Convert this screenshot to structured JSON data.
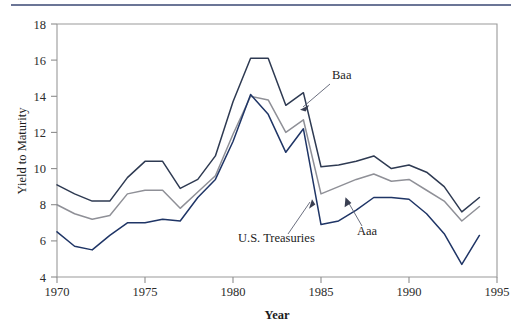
{
  "figure": {
    "top_rule_color": "#6b7596",
    "background": "#ffffff"
  },
  "chart_data": {
    "type": "line",
    "title": "",
    "xlabel": "Year",
    "ylabel": "Yield to Maturity",
    "xlim": [
      1970,
      1995
    ],
    "ylim": [
      4,
      18
    ],
    "xticks": [
      1970,
      1975,
      1980,
      1985,
      1990,
      1995
    ],
    "xtick_labels": [
      "1970",
      "1975",
      "1980",
      "1985",
      "1990",
      "1995"
    ],
    "yticks": [
      4,
      6,
      8,
      10,
      12,
      14,
      16,
      18
    ],
    "ytick_labels": [
      "4",
      "6",
      "8",
      "10",
      "12",
      "14",
      "16",
      "18"
    ],
    "grid": false,
    "legend": "annotations",
    "x": [
      1970,
      1971,
      1972,
      1973,
      1974,
      1975,
      1976,
      1977,
      1978,
      1979,
      1980,
      1981,
      1982,
      1983,
      1984,
      1985,
      1986,
      1987,
      1988,
      1989,
      1990,
      1991,
      1992,
      1993,
      1994
    ],
    "series": [
      {
        "name": "Baa",
        "color": "#2e3a52",
        "values": [
          9.1,
          8.6,
          8.2,
          8.2,
          9.5,
          10.4,
          10.4,
          8.9,
          9.4,
          10.7,
          13.7,
          16.1,
          16.1,
          13.5,
          14.2,
          10.1,
          10.2,
          10.4,
          10.7,
          10.0,
          10.2,
          9.8,
          9.0,
          7.6,
          8.4
        ]
      },
      {
        "name": "Aaa",
        "color": "#8f9097",
        "values": [
          8.0,
          7.5,
          7.2,
          7.4,
          8.6,
          8.8,
          8.8,
          7.8,
          8.7,
          9.6,
          11.9,
          14.0,
          13.8,
          12.0,
          12.7,
          8.6,
          9.0,
          9.4,
          9.7,
          9.3,
          9.4,
          8.8,
          8.2,
          7.1,
          7.9
        ]
      },
      {
        "name": "U.S. Treasuries",
        "color": "#1f3566",
        "values": [
          6.5,
          5.7,
          5.5,
          6.3,
          7.0,
          7.0,
          7.2,
          7.1,
          8.4,
          9.4,
          11.5,
          14.1,
          13.0,
          10.9,
          12.2,
          6.9,
          7.1,
          7.7,
          8.4,
          8.4,
          8.3,
          7.5,
          6.4,
          4.7,
          6.3
        ]
      }
    ],
    "annotations": [
      {
        "text": "Baa",
        "series": "Baa"
      },
      {
        "text": "Aaa",
        "series": "Aaa"
      },
      {
        "text": "U.S. Treasuries",
        "series": "U.S. Treasuries"
      }
    ]
  }
}
